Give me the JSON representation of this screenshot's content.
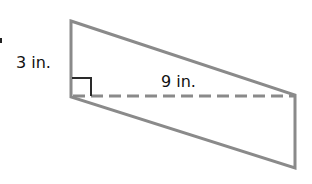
{
  "diagram": {
    "shape": "parallelogram",
    "stroke_color": "#8a8a8a",
    "right_angle_color": "#2a2a2a",
    "labels": {
      "height": "3 in.",
      "base": "9 in."
    },
    "vertices": [
      [
        71,
        21
      ],
      [
        295,
        95
      ],
      [
        295,
        168
      ],
      [
        71,
        97
      ]
    ],
    "dashed_line": {
      "from": [
        71,
        96
      ],
      "to": [
        295,
        96
      ]
    },
    "right_angle_marker": true
  }
}
